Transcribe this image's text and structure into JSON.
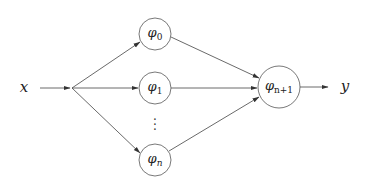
{
  "diagram": {
    "type": "neural-network-function-composition",
    "input": {
      "label": "x",
      "pos": [
        24,
        88
      ]
    },
    "output": {
      "label": "y",
      "pos": [
        345,
        87
      ]
    },
    "junction": {
      "pos": [
        72,
        88
      ]
    },
    "hidden_nodes": [
      {
        "id": "phi0",
        "symbol": "φ",
        "subscript": "0",
        "cx": 155,
        "cy": 34,
        "r": 16
      },
      {
        "id": "phi1",
        "symbol": "φ",
        "subscript": "1",
        "cx": 155,
        "cy": 88,
        "r": 16
      },
      {
        "id": "phin",
        "symbol": "φ",
        "subscript": "n",
        "cx": 155,
        "cy": 160,
        "r": 16
      }
    ],
    "ellipsis": {
      "text": "⋮",
      "pos": [
        155,
        120
      ]
    },
    "output_node": {
      "id": "phin1",
      "symbol": "φ",
      "subscript": "n+1",
      "cx": 279,
      "cy": 87,
      "r": 21
    },
    "edges": [
      {
        "from": "x",
        "to": "junction"
      },
      {
        "from": "junction",
        "to": "phi0"
      },
      {
        "from": "junction",
        "to": "phi1"
      },
      {
        "from": "junction",
        "to": "phin"
      },
      {
        "from": "phi0",
        "to": "phin1"
      },
      {
        "from": "phi1",
        "to": "phin1"
      },
      {
        "from": "phin",
        "to": "phin1"
      },
      {
        "from": "phin1",
        "to": "y"
      }
    ],
    "colors": {
      "line": "#444444",
      "node_stroke": "#555555",
      "text": "#222222",
      "background": "#ffffff"
    }
  }
}
